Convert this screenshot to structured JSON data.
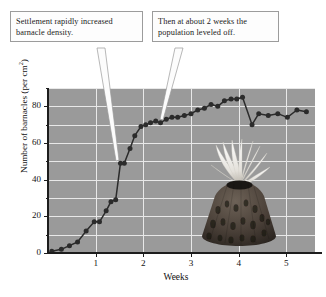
{
  "figure": {
    "background_color": "#ffffff",
    "plot_background_color": "#9a9a9a",
    "gridline_color": "#e8e8e8",
    "series_color": "#2b2b2b",
    "callout_border_color": "#9c9c9c"
  },
  "callouts": [
    {
      "name": "settlement",
      "line1": "Settlement rapidly increased",
      "line2": "barnacle density.",
      "points_to_week": 1.55,
      "points_to_value": 49
    },
    {
      "name": "plateau",
      "line1": "Then at about 2 weeks the",
      "line2": "population leveled off.",
      "points_to_week": 2.25,
      "points_to_value": 72
    }
  ],
  "illustration": {
    "name": "barnacle-photo",
    "description": "Acorn barnacle with extended white cirri"
  },
  "chart_data": {
    "type": "line",
    "title": "",
    "subtitle": "",
    "xlabel": "Weeks",
    "ylabel": "Number of barnacles (per cm2)",
    "ylabel_display": "Number of barnacles (per cm",
    "ylabel_exponent": "2",
    "ylabel_suffix": ")",
    "xlim": [
      0,
      5.6
    ],
    "ylim": [
      0,
      90
    ],
    "xticks": [
      1,
      2,
      3,
      4,
      5
    ],
    "xtick_labels": [
      "1",
      "2",
      "3",
      "4",
      "5"
    ],
    "yticks": [
      0,
      20,
      40,
      60,
      80
    ],
    "ytick_labels": [
      "0",
      "20",
      "40",
      "60",
      "80"
    ],
    "yticks_minor": [
      10,
      30,
      50,
      70,
      90
    ],
    "grid": true,
    "grid_axis": "both",
    "legend": "none",
    "marker": "circle",
    "series": [
      {
        "name": "Barnacle density",
        "x": [
          0.08,
          0.28,
          0.45,
          0.62,
          0.8,
          0.97,
          1.08,
          1.22,
          1.32,
          1.42,
          1.52,
          1.6,
          1.72,
          1.82,
          1.95,
          2.05,
          2.15,
          2.26,
          2.36,
          2.48,
          2.6,
          2.72,
          2.86,
          3.0,
          3.14,
          3.28,
          3.42,
          3.56,
          3.7,
          3.84,
          3.96,
          4.08,
          4.28,
          4.42,
          4.62,
          4.82,
          5.02,
          5.22,
          5.42
        ],
        "y": [
          1,
          2,
          4,
          6,
          12,
          17,
          17,
          23,
          28,
          29,
          49,
          49,
          57,
          64,
          69,
          70,
          71,
          72,
          71,
          73,
          74,
          74,
          75,
          76,
          78,
          79,
          81,
          80,
          83,
          84,
          84,
          85,
          70,
          76,
          75,
          76,
          74,
          78,
          77
        ]
      }
    ]
  }
}
